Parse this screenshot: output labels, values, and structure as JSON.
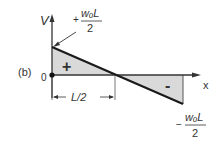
{
  "diagram": {
    "panel_label": "(b)",
    "y_axis_label": "V",
    "x_axis_label": "x",
    "origin_label": "0",
    "top_value": {
      "sign": "+",
      "numerator": "wₒL",
      "denominator": "2"
    },
    "bottom_value": {
      "sign": "−",
      "numerator": "wₒL",
      "denominator": "2"
    },
    "positive_region_label": "+",
    "negative_region_label": "-",
    "dimension_label": "L/2",
    "colors": {
      "fill": "#d9d9d9",
      "line": "#1a1a1a",
      "axis": "#333333"
    }
  }
}
